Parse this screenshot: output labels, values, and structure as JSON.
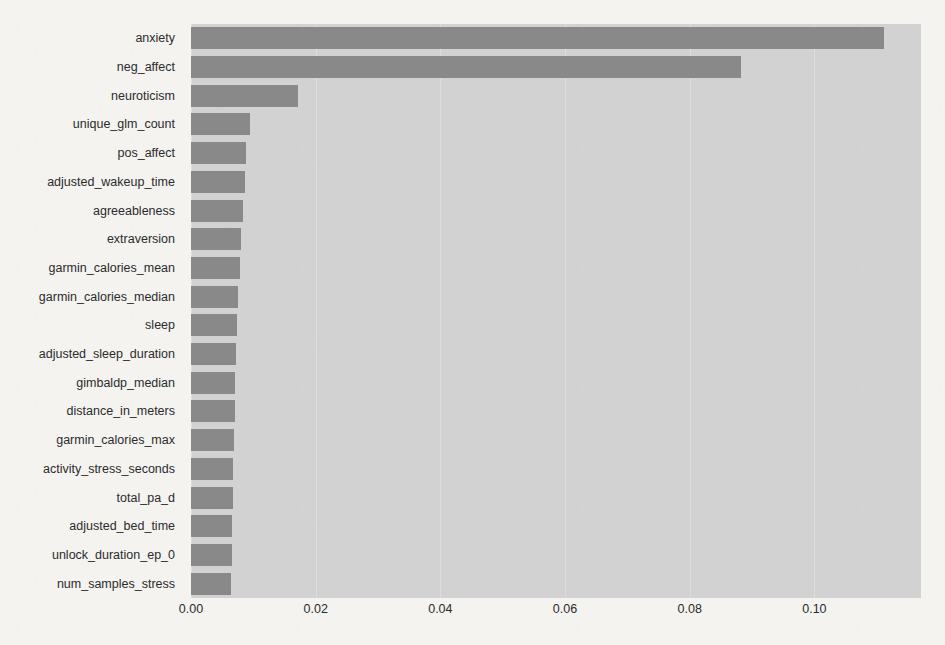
{
  "figure": {
    "background_color": "#f4f3f0",
    "plot_background_color": "#d2d2d2",
    "bar_color": "#898989",
    "grid_color": "#e4e4e4"
  },
  "chart_data": {
    "type": "bar",
    "orientation": "horizontal",
    "title": "",
    "xlabel": "",
    "ylabel": "",
    "xlim": [
      0.0,
      0.1171
    ],
    "xticks": [
      0.0,
      0.02,
      0.04,
      0.06,
      0.08,
      0.1
    ],
    "xticklabels": [
      "0.00",
      "0.02",
      "0.04",
      "0.06",
      "0.08",
      "0.10"
    ],
    "grid": true,
    "legend": null,
    "categories": [
      "anxiety",
      "neg_affect",
      "neuroticism",
      "unique_glm_count",
      "pos_affect",
      "adjusted_wakeup_time",
      "agreeableness",
      "extraversion",
      "garmin_calories_mean",
      "garmin_calories_median",
      "sleep",
      "adjusted_sleep_duration",
      "gimbaldp_median",
      "distance_in_meters",
      "garmin_calories_max",
      "activity_stress_seconds",
      "total_pa_d",
      "adjusted_bed_time",
      "unlock_duration_ep_0",
      "num_samples_stress"
    ],
    "values": [
      0.1112,
      0.0883,
      0.0172,
      0.0094,
      0.0088,
      0.0086,
      0.0084,
      0.0081,
      0.0079,
      0.0076,
      0.0074,
      0.0072,
      0.0071,
      0.007,
      0.0069,
      0.0068,
      0.0067,
      0.0066,
      0.0065,
      0.0064
    ]
  }
}
